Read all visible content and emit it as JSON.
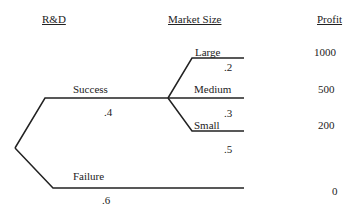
{
  "headers": {
    "rd": "R&D",
    "market_size": "Market Size",
    "profit": "Profit"
  },
  "rd_branches": [
    {
      "label": "Success",
      "probability": ".4"
    },
    {
      "label": "Failure",
      "probability": ".6"
    }
  ],
  "market_branches": [
    {
      "label": "Large",
      "probability": ".2",
      "profit": "1000"
    },
    {
      "label": "Medium",
      "probability": ".3",
      "profit": "500"
    },
    {
      "label": "Small",
      "probability": ".5",
      "profit": "200"
    }
  ],
  "failure_profit": "0",
  "line_color": "#222222"
}
